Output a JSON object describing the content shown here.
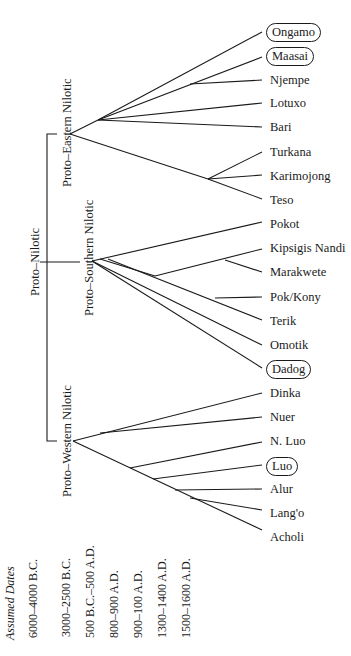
{
  "diagram": {
    "type": "language-family-tree",
    "root": {
      "label": "Proto–Nilotic",
      "children": [
        {
          "label": "Proto–Eastern Nilotic",
          "leaves": [
            "Ongamo",
            "Maasai",
            "Njempe",
            "Lotuxo",
            "Bari",
            "Turkana",
            "Karimojong",
            "Teso"
          ]
        },
        {
          "label": "Proto–Southern Nilotic",
          "leaves": [
            "Pokot",
            "Kipsigis Nandi",
            "Marakwete",
            "Pok/Kony",
            "Terik",
            "Omotik",
            "Dadog"
          ]
        },
        {
          "label": "Proto–Western Nilotic",
          "leaves": [
            "Dinka",
            "Nuer",
            "N. Luo",
            "Luo",
            "Alur",
            "Lang'o",
            "Acholi"
          ]
        }
      ]
    },
    "circled_leaves": [
      "Ongamo",
      "Maasai",
      "Dadog",
      "Luo"
    ]
  },
  "labels": {
    "proto_nilotic": "Proto–Nilotic",
    "proto_eastern": "Proto–Eastern Nilotic",
    "proto_southern": "Proto–Southern Nilotic",
    "proto_western": "Proto–Western Nilotic"
  },
  "leaves": {
    "ongamo": "Ongamo",
    "maasai": "Maasai",
    "njempe": "Njempe",
    "lotuxo": "Lotuxo",
    "bari": "Bari",
    "turkana": "Turkana",
    "karimojong": "Karimojong",
    "teso": "Teso",
    "pokot": "Pokot",
    "kipsigis_nandi": "Kipsigis Nandi",
    "marakwete": "Marakwete",
    "pok_kony": "Pok/Kony",
    "terik": "Terik",
    "omotik": "Omotik",
    "dadog": "Dadog",
    "dinka": "Dinka",
    "nuer": "Nuer",
    "n_luo": "N. Luo",
    "luo": "Luo",
    "alur": "Alur",
    "lango": "Lang'o",
    "acholi": "Acholi"
  },
  "dates": {
    "header": "Assumed Dates",
    "items": [
      "6000–4000 B.C.",
      "3000–2500 B.C.",
      "500 B.C.–500 A.D.",
      "800–900 A.D.",
      "900–100 A.D.",
      "1300–1400 A.D.",
      "1500–1600 A.D."
    ]
  }
}
